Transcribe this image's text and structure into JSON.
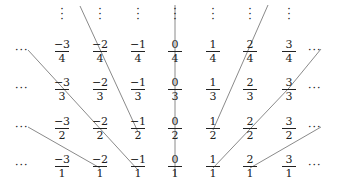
{
  "columns_x": [
    62,
    100,
    138,
    175,
    213,
    250,
    289
  ],
  "rows_y": [
    52,
    90,
    129,
    167
  ],
  "ellipsis": "···",
  "vdots": "⋮",
  "rows": [
    {
      "den": "4",
      "nums": [
        "−3",
        "−2",
        "−1",
        "0",
        "1",
        "2",
        "3"
      ]
    },
    {
      "den": "3",
      "nums": [
        "−3",
        "−2",
        "−1",
        "0",
        "1",
        "2",
        "3"
      ]
    },
    {
      "den": "2",
      "nums": [
        "−3",
        "−2",
        "−1",
        "0",
        "1",
        "2",
        "3"
      ]
    },
    {
      "den": "1",
      "nums": [
        "−3",
        "−2",
        "−1",
        "0",
        "1",
        "2",
        "3"
      ]
    }
  ],
  "line_color": "#8a8a8a",
  "lines": [
    {
      "x1": 80,
      "y1": 6,
      "x2": 138,
      "y2": 132
    },
    {
      "x1": 28,
      "y1": 50,
      "x2": 138,
      "y2": 170
    },
    {
      "x1": 28,
      "y1": 127,
      "x2": 100,
      "y2": 168
    },
    {
      "x1": 175,
      "y1": 5,
      "x2": 175,
      "y2": 176
    },
    {
      "x1": 213,
      "y1": 130,
      "x2": 268,
      "y2": 5
    },
    {
      "x1": 213,
      "y1": 168,
      "x2": 289,
      "y2": 88
    },
    {
      "x1": 289,
      "y1": 88,
      "x2": 321,
      "y2": 49
    },
    {
      "x1": 250,
      "y1": 168,
      "x2": 321,
      "y2": 127
    }
  ]
}
